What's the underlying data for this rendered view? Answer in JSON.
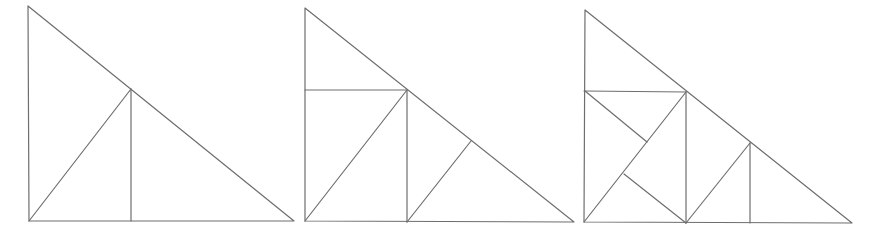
{
  "canvas": {
    "width": 884,
    "height": 245,
    "background": "#ffffff"
  },
  "style": {
    "stroke": "#6e6e6e",
    "stroke_width": 1.2
  },
  "figures": [
    {
      "name": "triangle-subdivision-step-1",
      "outline": [
        [
          28,
          6
        ],
        [
          29,
          221
        ],
        [
          294,
          221
        ]
      ],
      "segments": [
        [
          29,
          221,
          131,
          89
        ],
        [
          131,
          89,
          131,
          221
        ]
      ]
    },
    {
      "name": "triangle-subdivision-step-2",
      "outline": [
        [
          305,
          8
        ],
        [
          305,
          221
        ],
        [
          574,
          222
        ]
      ],
      "segments": [
        [
          305,
          90,
          407,
          90
        ],
        [
          305,
          221,
          407,
          90
        ],
        [
          407,
          90,
          407,
          222
        ],
        [
          471,
          141,
          407,
          222
        ]
      ]
    },
    {
      "name": "triangle-subdivision-step-3",
      "outline": [
        [
          585,
          10
        ],
        [
          584,
          222
        ],
        [
          852,
          223
        ]
      ],
      "segments": [
        [
          584,
          91,
          686,
          92
        ],
        [
          584,
          222,
          686,
          92
        ],
        [
          686,
          92,
          686,
          223
        ],
        [
          585,
          91,
          647,
          142
        ],
        [
          624,
          174,
          686,
          223
        ],
        [
          750,
          143,
          686,
          223
        ],
        [
          750,
          143,
          750,
          223
        ]
      ]
    }
  ]
}
